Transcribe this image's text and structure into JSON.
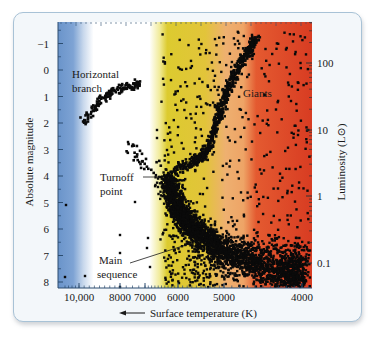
{
  "chart_data": {
    "type": "scatter",
    "title": "",
    "xlabel": "Surface temperature (K)",
    "xlabel_arrow": "←",
    "ylabel_left": "Absolute magnitude",
    "ylabel_right": "Luminosity (L⊙)",
    "x_axis": {
      "scale": "log-reversed",
      "ticks": [
        {
          "label": "10,000",
          "value": 10000
        },
        {
          "label": "8000",
          "value": 8000
        },
        {
          "label": "7000",
          "value": 7000
        },
        {
          "label": "6000",
          "value": 6000
        },
        {
          "label": "5000",
          "value": 5000
        },
        {
          "label": "4000",
          "value": 4000
        }
      ],
      "range": [
        11500,
        3850
      ]
    },
    "y_axis_left": {
      "ticks": [
        {
          "label": "−1",
          "value": -1
        },
        {
          "label": "0",
          "value": 0
        },
        {
          "label": "1",
          "value": 1
        },
        {
          "label": "2",
          "value": 2
        },
        {
          "label": "3",
          "value": 3
        },
        {
          "label": "4",
          "value": 4
        },
        {
          "label": "5",
          "value": 5
        },
        {
          "label": "6",
          "value": 6
        },
        {
          "label": "7",
          "value": 7
        },
        {
          "label": "8",
          "value": 8
        }
      ],
      "range": [
        -1.8,
        8.2
      ],
      "inverted": true
    },
    "y_axis_right": {
      "scale": "log",
      "ticks": [
        {
          "label": "100",
          "value": 100
        },
        {
          "label": "10",
          "value": 10
        },
        {
          "label": "1",
          "value": 1
        },
        {
          "label": "0.1",
          "value": 0.1
        }
      ]
    },
    "annotations": [
      {
        "text": "Horizontal",
        "line2": "branch",
        "x_temp": 10000,
        "mag": 0.1
      },
      {
        "text": "Giants",
        "x_temp": 5000,
        "mag": 1.4
      },
      {
        "text": "Turnoff",
        "line2": "point",
        "x_temp": 7200,
        "mag": 4.0,
        "points_to_mag": 4.1,
        "points_to_temp": 6150
      },
      {
        "text": "Main",
        "line2": "sequence",
        "x_temp": 8300,
        "mag": 7.0,
        "points_to_mag": 6.4,
        "points_to_temp": 6050
      }
    ],
    "color_bands": [
      {
        "from_temp": 11500,
        "to_temp": 9300,
        "color": "#6f98cc"
      },
      {
        "from_temp": 9000,
        "to_temp": 6600,
        "color": "#ffffff"
      },
      {
        "from_temp": 6300,
        "to_temp": 5400,
        "color": "#dcc92e"
      },
      {
        "from_temp": 5200,
        "to_temp": 4650,
        "color": "#eda766"
      },
      {
        "from_temp": 4450,
        "to_temp": 3850,
        "color": "#df4527"
      }
    ],
    "series": [
      {
        "name": "Horizontal branch",
        "approx_points": [
          [
            9800,
            2.0
          ],
          [
            9400,
            1.6
          ],
          [
            9000,
            1.2
          ],
          [
            8500,
            0.9
          ],
          [
            8000,
            0.7
          ],
          [
            7500,
            0.6
          ],
          [
            7200,
            0.5
          ]
        ]
      },
      {
        "name": "Subgiant branch",
        "approx_points": [
          [
            6100,
            3.8
          ],
          [
            5700,
            3.5
          ],
          [
            5500,
            3.3
          ],
          [
            5350,
            3.0
          ]
        ]
      },
      {
        "name": "Red giant branch",
        "approx_points": [
          [
            5350,
            3.0
          ],
          [
            5200,
            2.2
          ],
          [
            5050,
            1.3
          ],
          [
            4900,
            0.4
          ],
          [
            4750,
            -0.4
          ],
          [
            4600,
            -1.2
          ]
        ]
      },
      {
        "name": "Main sequence",
        "approx_points": [
          [
            6300,
            4.0
          ],
          [
            6100,
            5.0
          ],
          [
            5800,
            5.8
          ],
          [
            5400,
            6.4
          ],
          [
            5000,
            6.9
          ],
          [
            4600,
            7.3
          ],
          [
            4200,
            7.6
          ],
          [
            4000,
            7.7
          ]
        ]
      },
      {
        "name": "Blue stragglers",
        "approx_points": [
          [
            7500,
            2.8
          ],
          [
            7200,
            3.2
          ],
          [
            7000,
            3.5
          ],
          [
            6800,
            3.7
          ]
        ]
      }
    ],
    "grid": false,
    "legend": "none"
  }
}
